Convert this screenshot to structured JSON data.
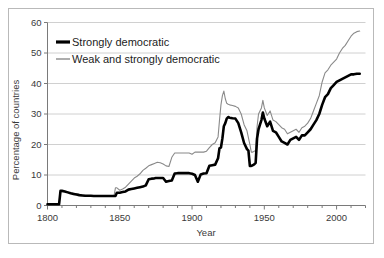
{
  "chart_data": {
    "type": "line",
    "title": "",
    "xlabel": "Year",
    "ylabel": "Percentage of countries",
    "xlim": [
      1800,
      2020
    ],
    "ylim": [
      0,
      60
    ],
    "xticks": [
      1800,
      1850,
      1900,
      1950,
      2000
    ],
    "xtick_labels": [
      "1800",
      "1850",
      "1900",
      "1950",
      "2000"
    ],
    "xminor_step": 10,
    "yticks": [
      0,
      10,
      20,
      30,
      40,
      50,
      60
    ],
    "ytick_labels": [
      "0",
      "10",
      "20",
      "30",
      "40",
      "50",
      "60"
    ],
    "grid": "horizontal",
    "legend_position": "top-left",
    "series": [
      {
        "name": "Strongly democratic",
        "color": "#000000",
        "width": 2.6,
        "x": [
          1800,
          1802,
          1804,
          1806,
          1808,
          1809,
          1810,
          1812,
          1814,
          1816,
          1818,
          1820,
          1822,
          1824,
          1826,
          1828,
          1830,
          1832,
          1834,
          1836,
          1838,
          1840,
          1842,
          1844,
          1846,
          1847,
          1848,
          1849,
          1850,
          1852,
          1854,
          1856,
          1858,
          1860,
          1862,
          1864,
          1866,
          1868,
          1870,
          1872,
          1874,
          1875,
          1876,
          1878,
          1880,
          1882,
          1884,
          1886,
          1888,
          1890,
          1892,
          1894,
          1896,
          1898,
          1900,
          1902,
          1904,
          1906,
          1908,
          1910,
          1912,
          1914,
          1916,
          1918,
          1919,
          1920,
          1921,
          1922,
          1923,
          1924,
          1925,
          1926,
          1928,
          1930,
          1932,
          1934,
          1936,
          1938,
          1939,
          1940,
          1941,
          1942,
          1943,
          1944,
          1945,
          1946,
          1947,
          1948,
          1949,
          1950,
          1952,
          1954,
          1956,
          1958,
          1960,
          1962,
          1964,
          1966,
          1968,
          1970,
          1972,
          1974,
          1976,
          1978,
          1980,
          1982,
          1984,
          1986,
          1988,
          1990,
          1992,
          1994,
          1996,
          1998,
          2000,
          2002,
          2004,
          2006,
          2008,
          2010,
          2012,
          2014,
          2016
        ],
        "y": [
          0.4,
          0.4,
          0.4,
          0.4,
          0.4,
          4.8,
          4.8,
          4.6,
          4.3,
          4.0,
          3.8,
          3.6,
          3.4,
          3.3,
          3.2,
          3.2,
          3.2,
          3.1,
          3.1,
          3.1,
          3.1,
          3.1,
          3.1,
          3.1,
          3.1,
          3.1,
          4.2,
          4.2,
          4.2,
          4.4,
          4.6,
          5.2,
          5.4,
          5.6,
          5.8,
          6.0,
          6.2,
          6.6,
          8.6,
          8.8,
          8.9,
          9.0,
          9.0,
          9.0,
          9.0,
          7.8,
          8.0,
          8.2,
          10.5,
          10.6,
          10.6,
          10.6,
          10.6,
          10.6,
          10.4,
          10.0,
          7.8,
          10.2,
          10.5,
          10.6,
          13.0,
          13.2,
          13.4,
          15.5,
          18.8,
          19.0,
          22.0,
          26.0,
          27.0,
          28.5,
          29.0,
          28.8,
          28.6,
          28.5,
          27.0,
          24.0,
          20.5,
          18.5,
          18.0,
          13.0,
          13.0,
          13.2,
          13.5,
          14.0,
          22.0,
          25.0,
          26.5,
          28.0,
          30.5,
          28.5,
          26.0,
          27.5,
          24.5,
          24.0,
          22.5,
          21.0,
          20.5,
          20.0,
          21.5,
          22.0,
          22.5,
          21.5,
          23.0,
          23.0,
          24.0,
          25.0,
          26.5,
          28.0,
          30.0,
          33.0,
          35.5,
          36.5,
          38.5,
          39.5,
          40.5,
          41.0,
          41.5,
          42.0,
          42.5,
          43.0,
          43.0,
          43.2,
          43.2
        ]
      },
      {
        "name": "Weak and strongly democratic",
        "color": "#8a8a8a",
        "width": 1.1,
        "x": [
          1800,
          1804,
          1808,
          1809,
          1812,
          1816,
          1820,
          1824,
          1828,
          1832,
          1836,
          1840,
          1844,
          1846,
          1847,
          1848,
          1850,
          1852,
          1854,
          1856,
          1858,
          1860,
          1862,
          1864,
          1866,
          1868,
          1870,
          1872,
          1874,
          1876,
          1878,
          1880,
          1882,
          1884,
          1886,
          1888,
          1890,
          1892,
          1894,
          1896,
          1898,
          1900,
          1902,
          1904,
          1906,
          1908,
          1910,
          1912,
          1914,
          1916,
          1918,
          1919,
          1920,
          1921,
          1922,
          1923,
          1924,
          1925,
          1926,
          1928,
          1930,
          1932,
          1934,
          1936,
          1938,
          1940,
          1941,
          1942,
          1943,
          1944,
          1945,
          1946,
          1947,
          1948,
          1949,
          1950,
          1952,
          1954,
          1956,
          1958,
          1960,
          1962,
          1964,
          1966,
          1968,
          1970,
          1972,
          1974,
          1976,
          1978,
          1980,
          1982,
          1984,
          1986,
          1988,
          1990,
          1992,
          1994,
          1996,
          1998,
          2000,
          2002,
          2004,
          2006,
          2008,
          2010,
          2012,
          2014,
          2016
        ],
        "y": [
          0.4,
          0.4,
          0.4,
          4.8,
          4.6,
          4.2,
          3.8,
          3.4,
          3.2,
          3.2,
          3.1,
          3.1,
          3.1,
          3.1,
          5.8,
          5.8,
          5.0,
          5.4,
          6.0,
          7.0,
          8.0,
          9.0,
          9.6,
          10.4,
          11.5,
          12.2,
          13.0,
          13.4,
          13.8,
          14.2,
          14.0,
          13.6,
          13.0,
          12.8,
          15.8,
          17.2,
          17.2,
          17.2,
          17.2,
          17.2,
          17.2,
          16.8,
          17.5,
          17.5,
          17.5,
          17.5,
          17.8,
          19.0,
          20.0,
          20.6,
          22.5,
          28.0,
          33.0,
          36.0,
          37.5,
          35.0,
          33.5,
          33.2,
          33.0,
          32.8,
          32.5,
          32.0,
          30.0,
          26.5,
          24.5,
          20.0,
          17.5,
          17.5,
          17.8,
          18.0,
          26.0,
          30.0,
          31.0,
          32.0,
          34.5,
          32.0,
          29.5,
          31.0,
          28.0,
          27.5,
          26.5,
          25.5,
          25.0,
          23.5,
          24.0,
          24.5,
          25.0,
          24.0,
          25.5,
          26.0,
          27.0,
          28.5,
          31.0,
          33.5,
          36.0,
          40.5,
          43.5,
          44.5,
          46.0,
          47.0,
          48.0,
          50.0,
          51.5,
          52.5,
          54.0,
          55.5,
          56.5,
          57.0,
          57.2
        ]
      }
    ],
    "legend": [
      {
        "label": "Strongly democratic",
        "color": "#000000",
        "width": 3.2
      },
      {
        "label": "Weak and strongly democratic",
        "color": "#8a8a8a",
        "width": 1.4
      }
    ]
  }
}
